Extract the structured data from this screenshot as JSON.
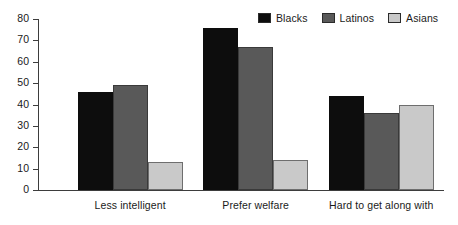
{
  "chart_data": {
    "type": "bar",
    "title": "",
    "xlabel": "",
    "ylabel": "",
    "ylim": [
      0,
      80
    ],
    "yticks": [
      0,
      10,
      20,
      30,
      40,
      50,
      60,
      70,
      80
    ],
    "grid": false,
    "legend_position": "top-right",
    "categories": [
      "Less intelligent",
      "Prefer welfare",
      "Hard to get along with"
    ],
    "series": [
      {
        "name": "Blacks",
        "color": "#0d0d0d",
        "values": [
          46,
          76,
          44
        ]
      },
      {
        "name": "Latinos",
        "color": "#595959",
        "values": [
          49,
          67,
          36
        ]
      },
      {
        "name": "Asians",
        "color": "#c9c9c9",
        "values": [
          13,
          14,
          40
        ]
      }
    ]
  },
  "legend": {
    "items": [
      {
        "label": "Blacks"
      },
      {
        "label": "Latinos"
      },
      {
        "label": "Asians"
      }
    ]
  },
  "axis": {
    "y_tick_labels": [
      "0",
      "10",
      "20",
      "30",
      "40",
      "50",
      "60",
      "70",
      "80"
    ]
  }
}
